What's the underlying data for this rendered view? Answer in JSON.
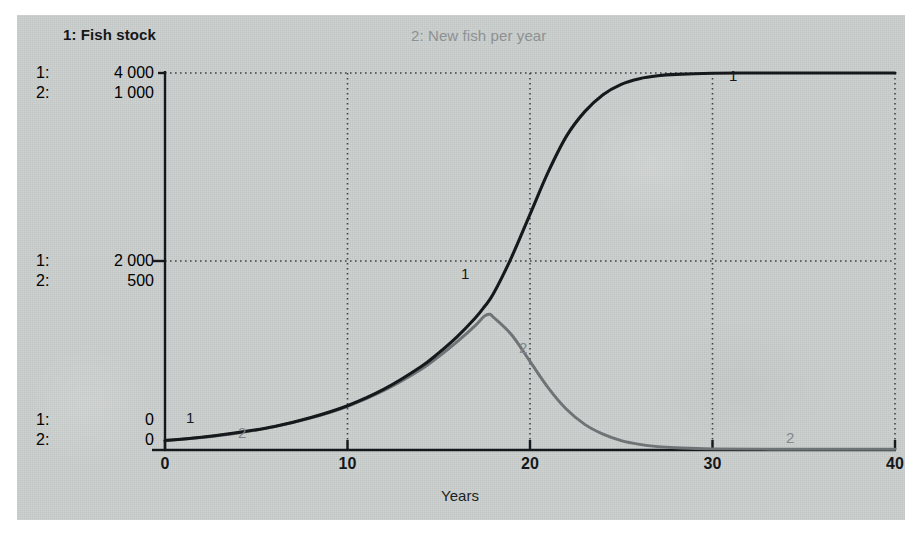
{
  "legend": {
    "series1": "1: Fish stock",
    "series2": "2: New fish per year"
  },
  "axis_labels": {
    "rows": [
      {
        "idx1": "1:",
        "val1": "4 000",
        "idx2": "2:",
        "val2": "1 000"
      },
      {
        "idx1": "1:",
        "val1": "2 000",
        "idx2": "2:",
        "val2": "500"
      },
      {
        "idx1": "1:",
        "val1": "0",
        "idx2": "2:",
        "val2": "0"
      }
    ]
  },
  "xaxis": {
    "title": "Years",
    "ticks": [
      "0",
      "10",
      "20",
      "30",
      "40"
    ]
  },
  "curve_tags": {
    "tag1_left": "1",
    "tag2_left": "2",
    "tag1_mid": "1",
    "tag2_mid": "2",
    "tag1_right": "1",
    "tag2_right": "2"
  },
  "colors": {
    "panel": "#c9cdcb",
    "series1": "#16181b",
    "series2": "#6e7376",
    "grid": "#4a4e51",
    "axis": "#1a1c1f"
  },
  "chart_data": {
    "type": "line",
    "title": "",
    "subtitle": "",
    "xlabel": "Years",
    "ylabel": "",
    "grid": true,
    "legend_position": "top",
    "xlim": [
      0,
      40
    ],
    "xticks": [
      0,
      10,
      20,
      30,
      40
    ],
    "axes": [
      {
        "id": 1,
        "name": "Fish stock",
        "ticks": [
          0,
          2000,
          4000
        ],
        "ylim": [
          0,
          4000
        ],
        "color": "#16181b"
      },
      {
        "id": 2,
        "name": "New fish per year",
        "ticks": [
          0,
          500,
          1000
        ],
        "ylim": [
          0,
          1000
        ],
        "color": "#6e7376"
      }
    ],
    "series": [
      {
        "name": "Fish stock",
        "axis": 1,
        "label": "1",
        "x": [
          0,
          2,
          4,
          6,
          8,
          10,
          12,
          14,
          15,
          16,
          17,
          17.5,
          18,
          19,
          20,
          21,
          22,
          23,
          24,
          25,
          26,
          27,
          28,
          30,
          32,
          35,
          40
        ],
        "y": [
          100,
          135,
          185,
          250,
          345,
          470,
          645,
          880,
          1030,
          1200,
          1400,
          1520,
          1660,
          2050,
          2500,
          2950,
          3330,
          3590,
          3770,
          3880,
          3940,
          3970,
          3985,
          3998,
          4000,
          4000,
          4000
        ]
      },
      {
        "name": "New fish per year",
        "axis": 2,
        "label": "2",
        "x": [
          0,
          2,
          4,
          6,
          8,
          10,
          12,
          14,
          15,
          16,
          17,
          17.5,
          17.8,
          18,
          19,
          20,
          21,
          22,
          23,
          24,
          25,
          26,
          27,
          28,
          30,
          35,
          40
        ],
        "y": [
          25,
          33,
          45,
          62,
          85,
          116,
          158,
          213,
          248,
          287,
          330,
          355,
          360,
          352,
          305,
          235,
          165,
          108,
          68,
          42,
          25,
          15,
          9,
          6,
          3,
          2,
          2
        ]
      }
    ],
    "annotations": [
      {
        "text": "1",
        "x": 1.1,
        "axis": 1,
        "note": "series-1 inline tag left"
      },
      {
        "text": "2",
        "x": 4.2,
        "axis": 2,
        "note": "series-2 inline tag left"
      },
      {
        "text": "1",
        "x": 16.6,
        "axis": 1,
        "note": "series-1 inline tag mid"
      },
      {
        "text": "2",
        "x": 19.6,
        "axis": 2,
        "note": "series-2 inline tag mid"
      },
      {
        "text": "1",
        "x": 31.0,
        "axis": 1,
        "note": "series-1 inline tag right"
      },
      {
        "text": "2",
        "x": 34.8,
        "axis": 2,
        "note": "series-2 inline tag right"
      }
    ]
  }
}
